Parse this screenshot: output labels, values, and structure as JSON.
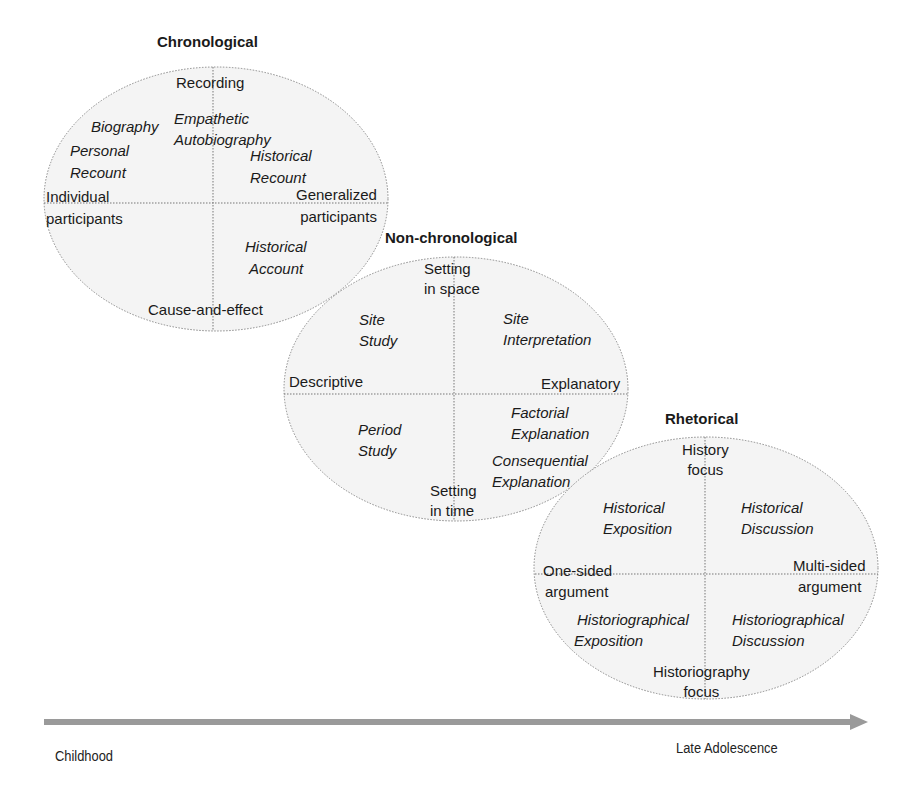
{
  "diagram": {
    "chronological": {
      "title": "Chronological",
      "axes": {
        "top": "Recording",
        "bottom": "Cause-and-effect",
        "left": [
          "Individual",
          "participants"
        ],
        "right": [
          "Generalized",
          "participants"
        ]
      },
      "genres": {
        "biography": "Biography",
        "personal_recount": [
          "Personal",
          "Recount"
        ],
        "empathetic_autobiography": [
          "Empathetic",
          "Autobiography"
        ],
        "historical_recount": [
          "Historical",
          "Recount"
        ],
        "historical_account": [
          "Historical",
          "Account"
        ]
      }
    },
    "non_chronological": {
      "title": "Non-chronological",
      "axes": {
        "top": [
          "Setting",
          "in space"
        ],
        "bottom": [
          "Setting",
          "in time"
        ],
        "left": "Descriptive",
        "right": "Explanatory"
      },
      "genres": {
        "site_study": [
          "Site",
          "Study"
        ],
        "site_interpretation": [
          "Site",
          "Interpretation"
        ],
        "period_study": [
          "Period",
          "Study"
        ],
        "factorial_explanation": [
          "Factorial",
          "Explanation"
        ],
        "consequential_explanation": [
          "Consequential",
          "Explanation"
        ]
      }
    },
    "rhetorical": {
      "title": "Rhetorical",
      "axes": {
        "top": [
          "History",
          "focus"
        ],
        "bottom": [
          "Historiography",
          "focus"
        ],
        "left": [
          "One-sided",
          "argument"
        ],
        "right": [
          "Multi-sided",
          "argument"
        ]
      },
      "genres": {
        "historical_exposition": [
          "Historical",
          "Exposition"
        ],
        "historical_discussion": [
          "Historical",
          "Discussion"
        ],
        "historiographical_exposition": [
          "Historiographical",
          "Exposition"
        ],
        "historiographical_discussion": [
          "Historiographical",
          "Discussion"
        ]
      }
    },
    "timeline": {
      "start": "Childhood",
      "end": "Late Adolescence"
    },
    "colors": {
      "ellipse_fill": "#f4f4f4",
      "ellipse_stroke": "#8a8a8a",
      "arrow": "#9a9a9a"
    }
  }
}
